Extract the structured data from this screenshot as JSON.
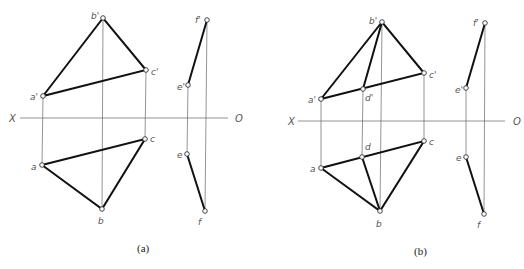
{
  "figures": [
    {
      "caption": "(a)",
      "axis": {
        "left_label": "X",
        "right_label": "O"
      },
      "points": {
        "a_prime": {
          "label": "a'"
        },
        "b_prime": {
          "label": "b'"
        },
        "c_prime": {
          "label": "c'"
        },
        "a": {
          "label": "a"
        },
        "b": {
          "label": "b"
        },
        "c": {
          "label": "c"
        },
        "e_prime": {
          "label": "e'"
        },
        "f_prime": {
          "label": "f'"
        },
        "e": {
          "label": "e"
        },
        "f": {
          "label": "f"
        }
      }
    },
    {
      "caption": "(b)",
      "axis": {
        "left_label": "X",
        "right_label": "O"
      },
      "points": {
        "a_prime": {
          "label": "a'"
        },
        "b_prime": {
          "label": "b'"
        },
        "c_prime": {
          "label": "c'"
        },
        "d_prime": {
          "label": "d'"
        },
        "a": {
          "label": "a"
        },
        "b": {
          "label": "b"
        },
        "c": {
          "label": "c"
        },
        "d": {
          "label": "d"
        },
        "e_prime": {
          "label": "e'"
        },
        "f_prime": {
          "label": "f'"
        },
        "e": {
          "label": "e"
        },
        "f": {
          "label": "f"
        }
      }
    }
  ]
}
